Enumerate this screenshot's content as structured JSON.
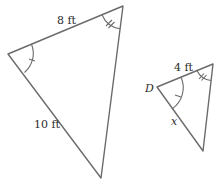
{
  "figure": {
    "stroke_color": "#6b6b6b",
    "text_color": "#2a2a2a"
  },
  "large_triangle": {
    "top_side_label": "8 ft",
    "left_side_label": "10 ft",
    "angle_marks": {
      "left_vertex": "single tick",
      "top_right_vertex": "double tick"
    }
  },
  "small_triangle": {
    "vertex_label": "D",
    "top_side_label": "4 ft",
    "left_side_label": "x",
    "angle_marks": {
      "D_vertex": "single tick",
      "top_right_vertex": "double tick"
    }
  }
}
